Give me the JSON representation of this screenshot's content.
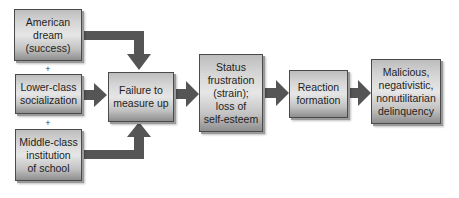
{
  "diagram": {
    "nodes": [
      {
        "id": "american-dream",
        "label": "American\ndream\n(success)"
      },
      {
        "id": "lower-class-socialization",
        "label": "Lower-class\nsocialization"
      },
      {
        "id": "middle-class-institution",
        "label": "Middle-class\ninstitution\nof school"
      },
      {
        "id": "failure-to-measure-up",
        "label": "Failure to\nmeasure up"
      },
      {
        "id": "status-frustration",
        "label": "Status\nfrustration\n(strain);\nloss of\nself-esteem"
      },
      {
        "id": "reaction-formation",
        "label": "Reaction\nformation"
      },
      {
        "id": "malicious-delinquency",
        "label": "Malicious,\nnegativistic,\nnonutilitarian\ndelinquency"
      }
    ],
    "connectors": [
      "+",
      "+"
    ],
    "edges": [
      {
        "from": "american-dream",
        "to": "failure-to-measure-up"
      },
      {
        "from": "lower-class-socialization",
        "to": "failure-to-measure-up"
      },
      {
        "from": "middle-class-institution",
        "to": "failure-to-measure-up"
      },
      {
        "from": "failure-to-measure-up",
        "to": "status-frustration"
      },
      {
        "from": "status-frustration",
        "to": "reaction-formation"
      },
      {
        "from": "reaction-formation",
        "to": "malicious-delinquency"
      }
    ],
    "colors": {
      "arrow": "#555555",
      "box_border": "#4a4a4a",
      "box_light": "#e6e6e6",
      "box_dark": "#8e8e8e"
    }
  }
}
